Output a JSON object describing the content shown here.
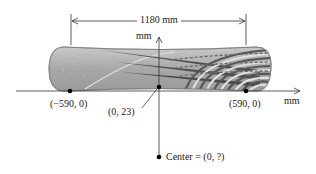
{
  "diagram": {
    "dimension": {
      "label": "1180 mm"
    },
    "axes": {
      "x_label": "mm",
      "y_label": "mm"
    },
    "points": [
      {
        "name": "left-endpoint",
        "label": "(−590, 0)"
      },
      {
        "name": "top-midpoint",
        "label": "(0, 23)"
      },
      {
        "name": "right-endpoint",
        "label": "(590, 0)"
      },
      {
        "name": "circle-center",
        "label": "Center = (0, ?)"
      }
    ],
    "colors": {
      "line": "#333333",
      "board_base": "#a9a9a9",
      "board_dark_stripe": "#555555",
      "board_light_stripe": "#d8d8d8",
      "board_edge": "#8a8a8a",
      "point": "#000000"
    }
  }
}
